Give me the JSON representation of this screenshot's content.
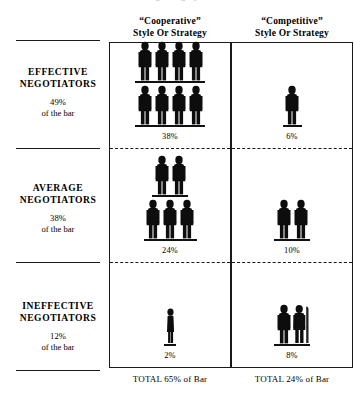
{
  "top_caption": "Negotiating Styles",
  "columns": [
    {
      "id": "cooperative",
      "title": "“Cooperative”",
      "subtitle": "Style Or Strategy",
      "total": "TOTAL 65% of Bar"
    },
    {
      "id": "competitive",
      "title": "“Competitive”",
      "subtitle": "Style Or Strategy",
      "total": "TOTAL 24% of Bar"
    }
  ],
  "rows": [
    {
      "id": "effective",
      "title": "EFFECTIVE",
      "title2": "NEGOTIATORS",
      "percent": "49%",
      "sub": "of the bar"
    },
    {
      "id": "average",
      "title": "AVERAGE",
      "title2": "NEGOTIATORS",
      "percent": "38%",
      "sub": "of the bar"
    },
    {
      "id": "ineffective",
      "title": "INEFFECTIVE",
      "title2": "NEGOTIATORS",
      "percent": "12%",
      "sub": "of the bar"
    }
  ],
  "cells": {
    "cooperative": [
      {
        "percent": "38%",
        "figure_rows": [
          4,
          4
        ],
        "icon": "person-icon"
      },
      {
        "percent": "24%",
        "figure_rows": [
          2,
          3
        ],
        "icon": "person-icon"
      },
      {
        "percent": "2%",
        "figure_rows": [
          1
        ],
        "icon": "person-icon"
      }
    ],
    "competitive": [
      {
        "percent": "6%",
        "figure_rows": [
          1
        ],
        "icon": "person-icon"
      },
      {
        "percent": "10%",
        "figure_rows": [
          2
        ],
        "icon": "person-icon"
      },
      {
        "percent": "8%",
        "figure_rows": [
          2
        ],
        "icon": "person-icon"
      }
    ]
  },
  "chart_data": {
    "type": "table",
    "title": "Negotiating Styles",
    "xlabel": "Style Or Strategy",
    "ylabel": "Negotiator Effectiveness",
    "categories": [
      "“Cooperative” Style Or Strategy",
      "“Competitive” Style Or Strategy"
    ],
    "series": [
      {
        "name": "EFFECTIVE NEGOTIATORS (49% of the bar)",
        "values": [
          38,
          6
        ]
      },
      {
        "name": "AVERAGE NEGOTIATORS (38% of the bar)",
        "values": [
          24,
          10
        ]
      },
      {
        "name": "INEFFECTIVE NEGOTIATORS (12% of the bar)",
        "values": [
          2,
          8
        ]
      }
    ],
    "totals": [
      65,
      24
    ],
    "total_labels": [
      "TOTAL 65% of Bar",
      "TOTAL 24% of Bar"
    ],
    "row_totals": [
      49,
      38,
      12
    ],
    "units": "percent of the bar",
    "pictogram_counts": {
      "cooperative": [
        8,
        5,
        1
      ],
      "competitive": [
        1,
        2,
        2
      ]
    },
    "grid": false,
    "legend": "none"
  }
}
